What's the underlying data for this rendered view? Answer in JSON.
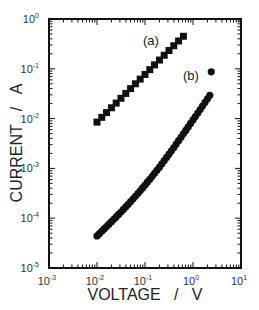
{
  "chart_data": {
    "type": "scatter",
    "title": "",
    "xlabel": "VOLTAGE   /   V",
    "ylabel": "CURRENT   /   A",
    "xscale": "log",
    "yscale": "log",
    "xlim": [
      0.001,
      10
    ],
    "ylim": [
      1e-05,
      1
    ],
    "x_tick_exponents": [
      -3,
      -2,
      -1,
      0,
      1
    ],
    "y_tick_exponents": [
      0,
      -1,
      -2,
      -3,
      -4,
      -5
    ],
    "tick_base": "10",
    "grid": false,
    "legend": "none",
    "series": [
      {
        "name": "(a)",
        "marker": "square",
        "label_position": "upper-left of curve end",
        "x": [
          0.01,
          0.0126,
          0.0158,
          0.02,
          0.0251,
          0.0316,
          0.0398,
          0.0501,
          0.0631,
          0.0794,
          0.1,
          0.126,
          0.158,
          0.2,
          0.251,
          0.316,
          0.398,
          0.501,
          0.631
        ],
        "y": [
          0.0085,
          0.0106,
          0.0132,
          0.0165,
          0.0205,
          0.0256,
          0.032,
          0.04,
          0.05,
          0.062,
          0.077,
          0.096,
          0.12,
          0.15,
          0.187,
          0.233,
          0.29,
          0.362,
          0.45
        ]
      },
      {
        "name": "(b)",
        "marker": "circle",
        "label_position": "left of curve end",
        "x": [
          0.01,
          0.0112,
          0.0126,
          0.0141,
          0.0158,
          0.0178,
          0.02,
          0.0224,
          0.0251,
          0.0282,
          0.0316,
          0.0355,
          0.0398,
          0.0447,
          0.0501,
          0.0562,
          0.0631,
          0.0708,
          0.0794,
          0.0891,
          0.1,
          0.112,
          0.126,
          0.141,
          0.158,
          0.178,
          0.2,
          0.224,
          0.251,
          0.282,
          0.316,
          0.355,
          0.398,
          0.447,
          0.501,
          0.562,
          0.631,
          0.708,
          0.794,
          0.891,
          1.0,
          1.12,
          1.26,
          1.41,
          1.58,
          1.78,
          2.0,
          2.24,
          2.4
        ],
        "y": [
          4.4e-05,
          4.9e-05,
          5.5e-05,
          6.1e-05,
          6.8e-05,
          7.6e-05,
          8.5e-05,
          9.5e-05,
          0.000106,
          0.000119,
          0.000133,
          0.00015,
          0.000169,
          0.00019,
          0.000215,
          0.000243,
          0.000275,
          0.000312,
          0.000355,
          0.000405,
          0.000462,
          0.000528,
          0.000605,
          0.000695,
          0.0008,
          0.00092,
          0.00106,
          0.00123,
          0.00143,
          0.00166,
          0.00193,
          0.00225,
          0.00263,
          0.00308,
          0.0036,
          0.00422,
          0.00495,
          0.0058,
          0.0068,
          0.008,
          0.0094,
          0.011,
          0.0129,
          0.0152,
          0.0179,
          0.0211,
          0.0249,
          0.0294,
          0.087
        ]
      }
    ]
  }
}
